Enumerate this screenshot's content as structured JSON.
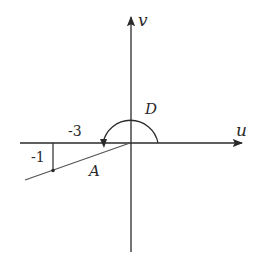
{
  "diagram": {
    "axes": {
      "horizontal_label": "u",
      "vertical_label": "v"
    },
    "labels": {
      "region_d": "D",
      "line_a": "A",
      "tick_u": "-3",
      "tick_v": "-1"
    },
    "colors": {
      "stroke": "#2a2a2a",
      "background": "#ffffff"
    }
  }
}
